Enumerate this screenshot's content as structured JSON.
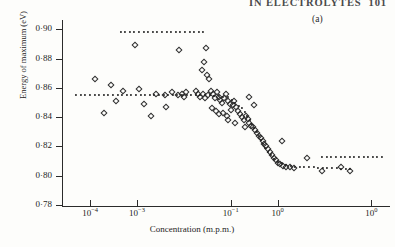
{
  "header": {
    "running_title": "IN  ELECTROLYTES",
    "page_number": "101"
  },
  "panel": {
    "label": "(a)"
  },
  "chart_data": {
    "type": "scatter",
    "title": "",
    "xlabel": "Concentration (m.p.m.)",
    "ylabel": "Energy of maximum (eV)",
    "xscale": "log",
    "yscale": "linear",
    "ylim": [
      0.78,
      0.905
    ],
    "xlim_exp": [
      -4.6,
      2.4
    ],
    "grid": false,
    "legend": "none",
    "ytick_labels": [
      "0·90",
      "0·88",
      "0·86",
      "0·84",
      "0·82",
      "0·80",
      "0·78"
    ],
    "ytick_values": [
      0.9,
      0.88,
      0.86,
      0.84,
      0.82,
      0.8,
      0.78
    ],
    "xtick_labels": [
      "10−4",
      "10−3",
      "10−1",
      "10⁰",
      "10⁰"
    ],
    "xtick_mantissa": [
      "10",
      "10",
      "10",
      "10",
      "10"
    ],
    "xtick_exponents": [
      "−4",
      "−3",
      "−1",
      "0",
      "0"
    ],
    "xtick_exp_values": [
      -4,
      -3,
      -1,
      0,
      2
    ],
    "marker": "open-diamond",
    "marker_color": "#2f2f2f",
    "points": [
      {
        "x": -3.05,
        "y": 0.889
      },
      {
        "x": -2.1,
        "y": 0.886
      },
      {
        "x": -1.52,
        "y": 0.887
      },
      {
        "x": -1.56,
        "y": 0.878
      },
      {
        "x": -1.62,
        "y": 0.872
      },
      {
        "x": -1.5,
        "y": 0.869
      },
      {
        "x": -1.46,
        "y": 0.866
      },
      {
        "x": -3.9,
        "y": 0.866
      },
      {
        "x": -3.55,
        "y": 0.862
      },
      {
        "x": -3.3,
        "y": 0.858
      },
      {
        "x": -2.95,
        "y": 0.859
      },
      {
        "x": -2.6,
        "y": 0.856
      },
      {
        "x": -2.4,
        "y": 0.855
      },
      {
        "x": -2.25,
        "y": 0.857
      },
      {
        "x": -2.12,
        "y": 0.855
      },
      {
        "x": -2.05,
        "y": 0.856
      },
      {
        "x": -2.0,
        "y": 0.854
      },
      {
        "x": -1.95,
        "y": 0.857
      },
      {
        "x": -3.45,
        "y": 0.851
      },
      {
        "x": -2.85,
        "y": 0.849
      },
      {
        "x": -2.38,
        "y": 0.847
      },
      {
        "x": -3.7,
        "y": 0.843
      },
      {
        "x": -1.74,
        "y": 0.858
      },
      {
        "x": -1.7,
        "y": 0.856
      },
      {
        "x": -1.66,
        "y": 0.854
      },
      {
        "x": -1.6,
        "y": 0.856
      },
      {
        "x": -1.55,
        "y": 0.853
      },
      {
        "x": -1.48,
        "y": 0.855
      },
      {
        "x": -1.42,
        "y": 0.858
      },
      {
        "x": -1.38,
        "y": 0.856
      },
      {
        "x": -1.34,
        "y": 0.853
      },
      {
        "x": -1.3,
        "y": 0.857
      },
      {
        "x": -1.26,
        "y": 0.854
      },
      {
        "x": -1.22,
        "y": 0.852
      },
      {
        "x": -1.18,
        "y": 0.85
      },
      {
        "x": -1.14,
        "y": 0.853
      },
      {
        "x": -1.1,
        "y": 0.856
      },
      {
        "x": -1.06,
        "y": 0.851
      },
      {
        "x": -1.02,
        "y": 0.849
      },
      {
        "x": -1.4,
        "y": 0.846
      },
      {
        "x": -1.32,
        "y": 0.844
      },
      {
        "x": -1.24,
        "y": 0.842
      },
      {
        "x": -1.16,
        "y": 0.843
      },
      {
        "x": -1.08,
        "y": 0.841
      },
      {
        "x": -1.0,
        "y": 0.845
      },
      {
        "x": -0.96,
        "y": 0.848
      },
      {
        "x": -0.92,
        "y": 0.851
      },
      {
        "x": -0.88,
        "y": 0.847
      },
      {
        "x": -0.84,
        "y": 0.844
      },
      {
        "x": -0.8,
        "y": 0.842
      },
      {
        "x": -0.76,
        "y": 0.84
      },
      {
        "x": -0.72,
        "y": 0.838
      },
      {
        "x": -0.68,
        "y": 0.841
      },
      {
        "x": -0.64,
        "y": 0.839
      },
      {
        "x": -0.6,
        "y": 0.836
      },
      {
        "x": -0.56,
        "y": 0.834
      },
      {
        "x": -0.52,
        "y": 0.833
      },
      {
        "x": -0.48,
        "y": 0.831
      },
      {
        "x": -0.44,
        "y": 0.829
      },
      {
        "x": -0.4,
        "y": 0.827
      },
      {
        "x": -0.36,
        "y": 0.826
      },
      {
        "x": -0.32,
        "y": 0.824
      },
      {
        "x": -0.28,
        "y": 0.822
      },
      {
        "x": -0.24,
        "y": 0.82
      },
      {
        "x": -0.2,
        "y": 0.818
      },
      {
        "x": -0.16,
        "y": 0.816
      },
      {
        "x": -0.12,
        "y": 0.814
      },
      {
        "x": -0.08,
        "y": 0.812
      },
      {
        "x": -0.04,
        "y": 0.811
      },
      {
        "x": 0.0,
        "y": 0.809
      },
      {
        "x": 0.06,
        "y": 0.808
      },
      {
        "x": 0.12,
        "y": 0.807
      },
      {
        "x": 0.18,
        "y": 0.806
      },
      {
        "x": 0.26,
        "y": 0.806
      },
      {
        "x": 0.34,
        "y": 0.805
      },
      {
        "x": 0.1,
        "y": 0.824
      },
      {
        "x": 0.62,
        "y": 0.812
      },
      {
        "x": 0.95,
        "y": 0.803
      },
      {
        "x": 1.35,
        "y": 0.806
      },
      {
        "x": 1.55,
        "y": 0.803
      },
      {
        "x": -0.62,
        "y": 0.854
      },
      {
        "x": -0.5,
        "y": 0.848
      },
      {
        "x": -0.7,
        "y": 0.833
      },
      {
        "x": -0.9,
        "y": 0.836
      },
      {
        "x": -1.05,
        "y": 0.838
      },
      {
        "x": -2.7,
        "y": 0.841
      }
    ],
    "trend_segments": [
      {
        "name": "upper-plateau",
        "style": "dotted",
        "points": [
          {
            "x": -3.35,
            "y": 0.8985
          },
          {
            "x": -1.55,
            "y": 0.8985
          }
        ]
      },
      {
        "name": "main-sigmoid",
        "style": "dotted",
        "points": [
          {
            "x": -4.3,
            "y": 0.8555
          },
          {
            "x": -2.4,
            "y": 0.8555
          },
          {
            "x": -1.45,
            "y": 0.855
          },
          {
            "x": -1.05,
            "y": 0.8535
          },
          {
            "x": -0.75,
            "y": 0.846
          },
          {
            "x": -0.5,
            "y": 0.833
          },
          {
            "x": -0.25,
            "y": 0.818
          },
          {
            "x": 0.0,
            "y": 0.8095
          },
          {
            "x": 0.35,
            "y": 0.806
          },
          {
            "x": 1.05,
            "y": 0.8055
          },
          {
            "x": 1.6,
            "y": 0.8045
          }
        ]
      },
      {
        "name": "lower-right-plateau",
        "style": "dotted",
        "points": [
          {
            "x": 0.95,
            "y": 0.8125
          },
          {
            "x": 2.3,
            "y": 0.8125
          }
        ]
      }
    ]
  }
}
